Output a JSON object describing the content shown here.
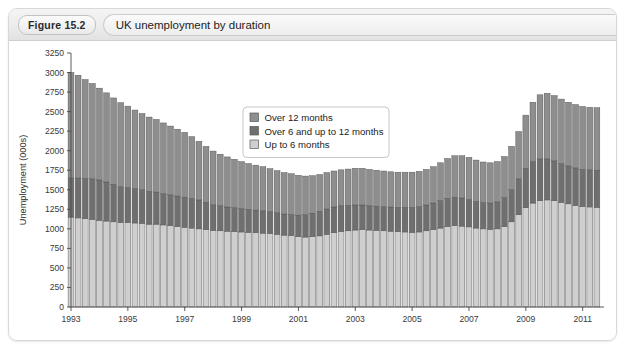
{
  "figure": {
    "badge": "Figure 15.2",
    "title": "UK unemployment by duration"
  },
  "chart_data": {
    "type": "bar",
    "stacked": true,
    "title": "UK unemployment by duration",
    "xlabel": "",
    "ylabel": "Unemployment (000s)",
    "ylim": [
      0,
      3250
    ],
    "ytick_step": 250,
    "yticks": [
      0,
      250,
      500,
      750,
      1000,
      1250,
      1500,
      1750,
      2000,
      2250,
      2500,
      2750,
      3000,
      3250
    ],
    "ytick_labels": [
      "0",
      "250",
      "500",
      "750",
      "1000",
      "1250",
      "1500",
      "1750",
      "2000",
      "2250",
      "2500",
      "2750",
      "3000",
      "3250"
    ],
    "xticks": [
      1993,
      1995,
      1997,
      1999,
      2001,
      2003,
      2005,
      2007,
      2009,
      2011
    ],
    "xtick_labels": [
      "1993",
      "1995",
      "1997",
      "1999",
      "2001",
      "2003",
      "2005",
      "2007",
      "2009",
      "2011"
    ],
    "xlim": [
      1993,
      2011.75
    ],
    "grid": false,
    "legend_position": "upper-center",
    "legend": [
      {
        "label": "Over 12 months",
        "color": "#8e8e8e"
      },
      {
        "label": "Over 6 and up to 12 months",
        "color": "#6f6f6f"
      },
      {
        "label": "Up to 6 months",
        "color": "#cfcfcf"
      }
    ],
    "x": [
      1993.0,
      1993.25,
      1993.5,
      1993.75,
      1994.0,
      1994.25,
      1994.5,
      1994.75,
      1995.0,
      1995.25,
      1995.5,
      1995.75,
      1996.0,
      1996.25,
      1996.5,
      1996.75,
      1997.0,
      1997.25,
      1997.5,
      1997.75,
      1998.0,
      1998.25,
      1998.5,
      1998.75,
      1999.0,
      1999.25,
      1999.5,
      1999.75,
      2000.0,
      2000.25,
      2000.5,
      2000.75,
      2001.0,
      2001.25,
      2001.5,
      2001.75,
      2002.0,
      2002.25,
      2002.5,
      2002.75,
      2003.0,
      2003.25,
      2003.5,
      2003.75,
      2004.0,
      2004.25,
      2004.5,
      2004.75,
      2005.0,
      2005.25,
      2005.5,
      2005.75,
      2006.0,
      2006.25,
      2006.5,
      2006.75,
      2007.0,
      2007.25,
      2007.5,
      2007.75,
      2008.0,
      2008.25,
      2008.5,
      2008.75,
      2009.0,
      2009.25,
      2009.5,
      2009.75,
      2010.0,
      2010.25,
      2010.5,
      2010.75,
      2011.0,
      2011.25,
      2011.5
    ],
    "series": [
      {
        "name": "Up to 6 months",
        "color": "#cfcfcf",
        "values": [
          1150,
          1140,
          1130,
          1120,
          1110,
          1100,
          1090,
          1080,
          1080,
          1075,
          1070,
          1060,
          1060,
          1050,
          1040,
          1030,
          1020,
          1010,
          1000,
          990,
          980,
          975,
          970,
          965,
          960,
          955,
          950,
          945,
          940,
          930,
          920,
          915,
          900,
          895,
          900,
          910,
          930,
          950,
          965,
          975,
          985,
          990,
          985,
          980,
          975,
          970,
          965,
          960,
          955,
          960,
          975,
          990,
          1010,
          1030,
          1040,
          1035,
          1025,
          1010,
          1000,
          995,
          1000,
          1030,
          1090,
          1180,
          1270,
          1330,
          1360,
          1370,
          1360,
          1340,
          1320,
          1300,
          1285,
          1280,
          1275
        ]
      },
      {
        "name": "Over 6 and up to 12 months",
        "color": "#6f6f6f",
        "values": [
          500,
          510,
          515,
          520,
          515,
          500,
          480,
          460,
          450,
          440,
          430,
          420,
          410,
          400,
          395,
          390,
          385,
          380,
          370,
          350,
          330,
          320,
          310,
          305,
          300,
          295,
          290,
          285,
          280,
          275,
          270,
          270,
          275,
          285,
          300,
          315,
          325,
          330,
          330,
          325,
          320,
          315,
          310,
          310,
          310,
          310,
          310,
          315,
          320,
          325,
          330,
          340,
          350,
          360,
          365,
          360,
          350,
          340,
          335,
          335,
          345,
          370,
          410,
          460,
          505,
          530,
          535,
          525,
          510,
          495,
          485,
          480,
          475,
          475,
          475
        ]
      },
      {
        "name": "Over 12 months",
        "color": "#8e8e8e",
        "values": [
          1350,
          1315,
          1265,
          1220,
          1175,
          1140,
          1105,
          1075,
          1040,
          1005,
          975,
          950,
          930,
          905,
          880,
          855,
          830,
          790,
          750,
          715,
          685,
          660,
          640,
          620,
          600,
          585,
          575,
          565,
          550,
          540,
          530,
          520,
          510,
          495,
          480,
          470,
          465,
          460,
          460,
          465,
          470,
          470,
          465,
          460,
          455,
          450,
          450,
          450,
          450,
          450,
          455,
          465,
          485,
          510,
          530,
          540,
          540,
          530,
          520,
          515,
          515,
          525,
          555,
          605,
          680,
          760,
          820,
          840,
          835,
          825,
          815,
          810,
          805,
          800,
          800
        ]
      }
    ]
  }
}
